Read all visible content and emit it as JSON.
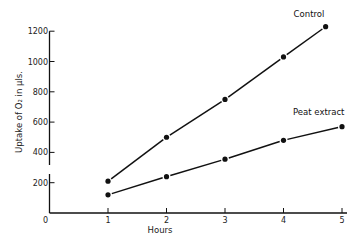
{
  "chart_data": {
    "type": "line",
    "title": "",
    "xlabel": "Hours",
    "ylabel": "Uptake of O₂ in μls.",
    "xlim": [
      0,
      5
    ],
    "ylim": [
      0,
      1200
    ],
    "x_ticks": [
      "0",
      "1",
      "2",
      "3",
      "4",
      "5"
    ],
    "y_ticks": [
      "200",
      "400",
      "600",
      "800",
      "1000",
      "1200"
    ],
    "grid": false,
    "legend": "inline labels at line ends",
    "series": [
      {
        "name": "Control",
        "x": [
          1,
          2,
          3,
          4,
          4.72
        ],
        "values": [
          210,
          500,
          750,
          1030,
          1230
        ]
      },
      {
        "name": "Peat extract",
        "x": [
          1,
          2,
          3,
          4,
          5
        ],
        "values": [
          120,
          240,
          355,
          480,
          570
        ]
      }
    ]
  },
  "colors": {
    "ink": "#111111",
    "background": "#ffffff"
  }
}
